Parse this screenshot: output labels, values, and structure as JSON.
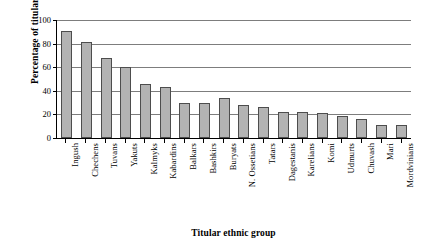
{
  "chart_data": {
    "type": "bar",
    "title": "",
    "xlabel": "Titular ethnic group",
    "ylabel": "Percentage of titular support",
    "ylim": [
      0,
      100
    ],
    "yticks": [
      0,
      20,
      40,
      60,
      80,
      100
    ],
    "grid": true,
    "legend": "none",
    "categories": [
      "Ingush",
      "Chechens",
      "Tuvans",
      "Yakuts",
      "Kalmyks",
      "Kabardins",
      "Balkars",
      "Bashkirs",
      "Buryats",
      "N. Ossetians",
      "Tatars",
      "Dagestanis",
      "Karelians",
      "Komi",
      "Udmurts",
      "Chuvash",
      "Mari",
      "Mordvinians"
    ],
    "values": [
      91,
      81,
      68,
      60,
      46,
      43,
      30,
      30,
      34,
      28,
      26,
      22,
      22,
      21,
      19,
      16,
      11,
      11
    ],
    "bar_fill_color": "#b3b3b3",
    "bar_edge_color": "#4d4d4d"
  }
}
